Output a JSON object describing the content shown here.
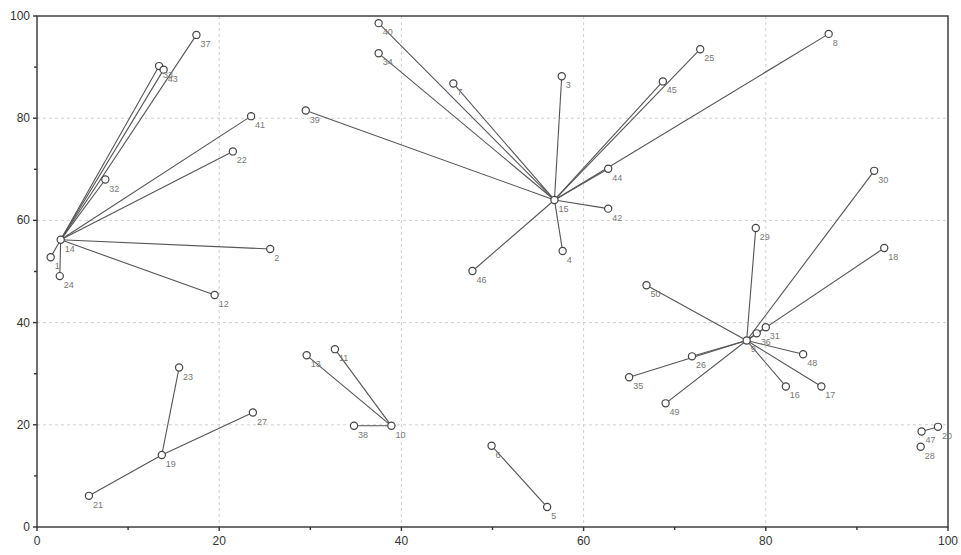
{
  "chart_data": {
    "type": "scatter",
    "title": "",
    "xlabel": "",
    "ylabel": "",
    "xlim": [
      0,
      100
    ],
    "ylim": [
      0,
      100
    ],
    "grid": true,
    "legend": null,
    "x_ticks": [
      "0",
      "20",
      "40",
      "60",
      "80",
      "100"
    ],
    "y_ticks": [
      "0",
      "20",
      "40",
      "60",
      "80",
      "100"
    ],
    "points": [
      {
        "id": "1",
        "x": 1.5,
        "y": 52.8
      },
      {
        "id": "2",
        "x": 25.6,
        "y": 54.4
      },
      {
        "id": "3",
        "x": 57.6,
        "y": 88.2
      },
      {
        "id": "4",
        "x": 57.7,
        "y": 54.0
      },
      {
        "id": "5",
        "x": 56.0,
        "y": 3.9
      },
      {
        "id": "6",
        "x": 49.9,
        "y": 15.9
      },
      {
        "id": "7",
        "x": 45.7,
        "y": 86.8
      },
      {
        "id": "8",
        "x": 86.9,
        "y": 96.5
      },
      {
        "id": "9",
        "x": 77.9,
        "y": 36.5
      },
      {
        "id": "10",
        "x": 38.9,
        "y": 19.8
      },
      {
        "id": "11",
        "x": 32.7,
        "y": 34.8
      },
      {
        "id": "12",
        "x": 19.5,
        "y": 45.4
      },
      {
        "id": "13",
        "x": 29.6,
        "y": 33.6
      },
      {
        "id": "14",
        "x": 2.6,
        "y": 56.2
      },
      {
        "id": "15",
        "x": 56.8,
        "y": 64.0
      },
      {
        "id": "16",
        "x": 82.2,
        "y": 27.5
      },
      {
        "id": "17",
        "x": 86.1,
        "y": 27.5
      },
      {
        "id": "18",
        "x": 93.0,
        "y": 54.6
      },
      {
        "id": "19",
        "x": 13.7,
        "y": 14.1
      },
      {
        "id": "20",
        "x": 98.9,
        "y": 19.6
      },
      {
        "id": "21",
        "x": 5.7,
        "y": 6.1
      },
      {
        "id": "22",
        "x": 21.5,
        "y": 73.5
      },
      {
        "id": "23",
        "x": 15.6,
        "y": 31.2
      },
      {
        "id": "24",
        "x": 2.5,
        "y": 49.1
      },
      {
        "id": "25",
        "x": 72.8,
        "y": 93.5
      },
      {
        "id": "26",
        "x": 71.9,
        "y": 33.4
      },
      {
        "id": "27",
        "x": 23.7,
        "y": 22.4
      },
      {
        "id": "28",
        "x": 97.0,
        "y": 15.7
      },
      {
        "id": "29",
        "x": 78.9,
        "y": 58.5
      },
      {
        "id": "30",
        "x": 91.9,
        "y": 69.7
      },
      {
        "id": "31",
        "x": 80.0,
        "y": 39.1
      },
      {
        "id": "32",
        "x": 7.5,
        "y": 68.0
      },
      {
        "id": "33",
        "x": 13.4,
        "y": 90.2
      },
      {
        "id": "34",
        "x": 37.5,
        "y": 92.7
      },
      {
        "id": "35",
        "x": 65.0,
        "y": 29.3
      },
      {
        "id": "36",
        "x": 79.0,
        "y": 37.9
      },
      {
        "id": "37",
        "x": 17.5,
        "y": 96.3
      },
      {
        "id": "38",
        "x": 34.8,
        "y": 19.8
      },
      {
        "id": "39",
        "x": 29.5,
        "y": 81.5
      },
      {
        "id": "40",
        "x": 37.5,
        "y": 98.6
      },
      {
        "id": "41",
        "x": 23.5,
        "y": 80.4
      },
      {
        "id": "42",
        "x": 62.7,
        "y": 62.3
      },
      {
        "id": "43",
        "x": 13.9,
        "y": 89.5
      },
      {
        "id": "44",
        "x": 62.7,
        "y": 70.1
      },
      {
        "id": "45",
        "x": 68.7,
        "y": 87.2
      },
      {
        "id": "46",
        "x": 47.8,
        "y": 50.1
      },
      {
        "id": "47",
        "x": 97.1,
        "y": 18.7
      },
      {
        "id": "48",
        "x": 84.1,
        "y": 33.8
      },
      {
        "id": "49",
        "x": 69.0,
        "y": 24.2
      },
      {
        "id": "50",
        "x": 66.9,
        "y": 47.3
      }
    ],
    "edges": [
      [
        "14",
        "1"
      ],
      [
        "14",
        "24"
      ],
      [
        "14",
        "32"
      ],
      [
        "14",
        "33"
      ],
      [
        "14",
        "43"
      ],
      [
        "14",
        "37"
      ],
      [
        "14",
        "41"
      ],
      [
        "14",
        "22"
      ],
      [
        "14",
        "2"
      ],
      [
        "14",
        "12"
      ],
      [
        "19",
        "21"
      ],
      [
        "19",
        "23"
      ],
      [
        "19",
        "27"
      ],
      [
        "15",
        "39"
      ],
      [
        "15",
        "40"
      ],
      [
        "15",
        "34"
      ],
      [
        "15",
        "7"
      ],
      [
        "15",
        "3"
      ],
      [
        "15",
        "45"
      ],
      [
        "15",
        "25"
      ],
      [
        "15",
        "8"
      ],
      [
        "15",
        "44"
      ],
      [
        "15",
        "42"
      ],
      [
        "15",
        "4"
      ],
      [
        "15",
        "46"
      ],
      [
        "10",
        "13"
      ],
      [
        "10",
        "11"
      ],
      [
        "10",
        "38"
      ],
      [
        "6",
        "5"
      ],
      [
        "9",
        "29"
      ],
      [
        "9",
        "30"
      ],
      [
        "9",
        "18"
      ],
      [
        "9",
        "36"
      ],
      [
        "9",
        "31"
      ],
      [
        "9",
        "50"
      ],
      [
        "9",
        "26"
      ],
      [
        "9",
        "35"
      ],
      [
        "9",
        "49"
      ],
      [
        "9",
        "48"
      ],
      [
        "9",
        "16"
      ],
      [
        "9",
        "17"
      ],
      [
        "47",
        "20"
      ]
    ]
  }
}
